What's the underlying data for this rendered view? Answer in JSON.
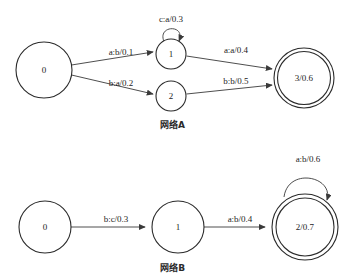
{
  "page": {
    "clipped_header_fragment": "",
    "background_color": "#ffffff",
    "stroke_color": "#3a3a3a",
    "text_color": "#1c1c1c"
  },
  "figures": [
    {
      "id": "network-a",
      "caption": "网络A",
      "states": [
        {
          "id": "0",
          "label": "0",
          "final": false,
          "cx": 44,
          "cy": 62,
          "r": 28
        },
        {
          "id": "1",
          "label": "1",
          "final": false,
          "cx": 171,
          "cy": 46,
          "r": 15
        },
        {
          "id": "2",
          "label": "2",
          "final": false,
          "cx": 171,
          "cy": 88,
          "r": 15
        },
        {
          "id": "3",
          "label": "3/0.6",
          "final": true,
          "cx": 304,
          "cy": 70,
          "r": 30
        }
      ],
      "transitions": [
        {
          "from": "0",
          "to": "1",
          "label": "a:b/0.1",
          "lx": 121,
          "ly": 47
        },
        {
          "from": "0",
          "to": "2",
          "label": "b:a/0.2",
          "lx": 121,
          "ly": 77
        },
        {
          "from": "1",
          "to": "3",
          "label": "a:a/0.4",
          "lx": 235,
          "ly": 46
        },
        {
          "from": "2",
          "to": "3",
          "label": "b:b/0.5",
          "lx": 235,
          "ly": 77
        },
        {
          "from": "1",
          "to": "1",
          "label": "c:a/0.3",
          "lx": 171,
          "ly": 15,
          "self_loop": true
        }
      ]
    },
    {
      "id": "network-b",
      "caption": "网络B",
      "states": [
        {
          "id": "0",
          "label": "0",
          "final": false,
          "cx": 45,
          "cy": 79,
          "r": 26
        },
        {
          "id": "1",
          "label": "1",
          "final": false,
          "cx": 178,
          "cy": 79,
          "r": 26
        },
        {
          "id": "2",
          "label": "2/0.7",
          "final": true,
          "cx": 305,
          "cy": 79,
          "r": 33
        }
      ],
      "transitions": [
        {
          "from": "0",
          "to": "1",
          "label": "b:c/0.3",
          "lx": 116,
          "ly": 73
        },
        {
          "from": "1",
          "to": "2",
          "label": "a:b/0.4",
          "lx": 240,
          "ly": 73
        },
        {
          "from": "2",
          "to": "2",
          "label": "a:b/0.6",
          "lx": 307,
          "ly": 12,
          "self_loop": true
        }
      ]
    }
  ]
}
